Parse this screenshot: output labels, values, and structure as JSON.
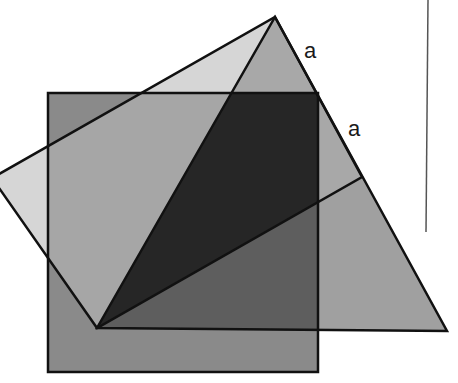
{
  "diagram": {
    "labels": [
      {
        "text": "a",
        "x": 304,
        "y": 58
      },
      {
        "text": "a",
        "x": 348,
        "y": 136
      }
    ],
    "colors": {
      "background": "#ffffff",
      "stroke": "#111111",
      "square": "#8a8a8a",
      "rotated_square": "#d6d6d6",
      "triangle": "#a0a0a0",
      "overlap_square_rotated": "#a6a6a6",
      "overlap_all": "#262626",
      "overlap_square_triangle": "#5e5e5e",
      "overlap_rotated_triangle": "#b4b4b4",
      "vertical_line": "#555555"
    }
  }
}
